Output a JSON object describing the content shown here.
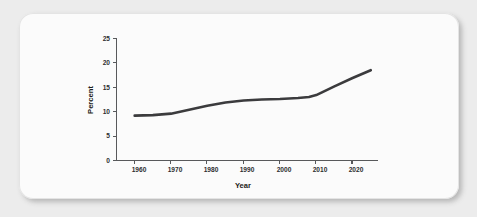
{
  "card": {
    "background_color": "#fbfbfb",
    "page_background_color": "#ececec"
  },
  "chart_data": {
    "type": "line",
    "title": "",
    "xlabel": "Year",
    "ylabel": "Percent",
    "xlim": [
      1955,
      2027
    ],
    "ylim": [
      0,
      25
    ],
    "grid": false,
    "legend": false,
    "line_color": "#3b3b3d",
    "axis_color": "#58595b",
    "x_ticks": [
      1960,
      1970,
      1980,
      1990,
      2000,
      2010,
      2020
    ],
    "x_tick_labels": [
      "1960",
      "1970",
      "1980",
      "1990",
      "2000",
      "2010",
      "2020"
    ],
    "y_ticks": [
      0,
      5,
      10,
      15,
      20,
      25
    ],
    "y_tick_labels": [
      "0",
      "5",
      "10",
      "15",
      "20",
      "25"
    ],
    "series": [
      {
        "name": "Percent",
        "x": [
          1960,
          1965,
          1970,
          1975,
          1980,
          1985,
          1990,
          1995,
          2000,
          2005,
          2008,
          2010,
          2015,
          2020,
          2025
        ],
        "values": [
          9.2,
          9.3,
          9.6,
          10.4,
          11.2,
          11.9,
          12.3,
          12.5,
          12.6,
          12.8,
          13.0,
          13.4,
          15.2,
          16.9,
          18.5
        ]
      }
    ]
  }
}
